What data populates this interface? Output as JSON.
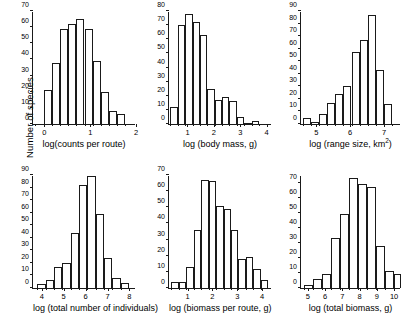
{
  "figure": {
    "shared_ylabel": "Number of species",
    "background": "#ffffff",
    "line_color": "#1a1a1a"
  },
  "chart_data": [
    {
      "id": "counts-per-route",
      "type": "bar",
      "title": "",
      "xlabel": "log(counts per route)",
      "ylabel": "Number of species",
      "xlim": [
        -0.25,
        2.0
      ],
      "ylim": [
        0,
        70
      ],
      "yticks": [
        0,
        10,
        20,
        30,
        40,
        50,
        60,
        70
      ],
      "xticks": [
        0,
        1,
        2
      ],
      "grid": false,
      "legend": "none",
      "bin_width": 0.175,
      "bin_starts": [
        -0.2,
        0.0,
        0.175,
        0.35,
        0.525,
        0.7,
        0.875,
        1.05,
        1.225,
        1.4,
        1.575,
        1.75
      ],
      "categories": [
        "-0.2",
        "0.0",
        "0.18",
        "0.35",
        "0.53",
        "0.70",
        "0.88",
        "1.05",
        "1.23",
        "1.40",
        "1.58",
        "1.75"
      ],
      "values": [
        0,
        21,
        38,
        59,
        62,
        65,
        59,
        39,
        20,
        8,
        6,
        0
      ]
    },
    {
      "id": "body-mass",
      "type": "bar",
      "title": "",
      "xlabel": "log (body mass, g)",
      "ylabel": "Number of species",
      "xlim": [
        0.3,
        4.2
      ],
      "ylim": [
        0,
        80
      ],
      "yticks": [
        0,
        10,
        20,
        30,
        40,
        50,
        60,
        70,
        80
      ],
      "xticks": [
        1,
        2,
        3,
        4
      ],
      "grid": false,
      "legend": "none",
      "bin_width": 0.28,
      "bin_starts": [
        0.35,
        0.63,
        0.91,
        1.19,
        1.47,
        1.75,
        2.03,
        2.31,
        2.59,
        2.87,
        3.15,
        3.43,
        3.71
      ],
      "categories": [
        "0.35",
        "0.63",
        "0.91",
        "1.19",
        "1.47",
        "1.75",
        "2.03",
        "2.31",
        "2.59",
        "2.87",
        "3.15",
        "3.43",
        "3.71"
      ],
      "values": [
        12,
        70,
        78,
        72,
        63,
        25,
        17,
        19,
        16,
        5,
        1,
        2,
        0
      ]
    },
    {
      "id": "range-size",
      "type": "bar",
      "title": "",
      "xlabel": "log (range size, km2)",
      "xlabel_base": "log (range size, km",
      "xlabel_sup": "2",
      "xlabel_tail": ")",
      "ylabel": "Number of species",
      "xlim": [
        4.55,
        7.5
      ],
      "ylim": [
        0,
        90
      ],
      "yticks": [
        0,
        10,
        20,
        30,
        40,
        50,
        60,
        70,
        80,
        90
      ],
      "xticks": [
        5,
        6,
        7
      ],
      "grid": false,
      "legend": "none",
      "bin_width": 0.24,
      "bin_starts": [
        4.6,
        4.84,
        5.08,
        5.32,
        5.56,
        5.8,
        6.04,
        6.28,
        6.52,
        6.76,
        7.0,
        7.24
      ],
      "categories": [
        "4.60",
        "4.84",
        "5.08",
        "5.32",
        "5.56",
        "5.80",
        "6.04",
        "6.28",
        "6.52",
        "6.76",
        "7.00",
        "7.24"
      ],
      "values": [
        5,
        2,
        8,
        17,
        24,
        30,
        57,
        67,
        87,
        43,
        16,
        0
      ]
    },
    {
      "id": "total-number-individuals",
      "type": "bar",
      "title": "",
      "xlabel": "log (total number of individuals)",
      "ylabel": "Number of species",
      "xlim": [
        3.6,
        8.3
      ],
      "ylim": [
        0,
        90
      ],
      "yticks": [
        0,
        10,
        20,
        30,
        40,
        50,
        60,
        70,
        80,
        90
      ],
      "xticks": [
        4,
        5,
        6,
        7,
        8
      ],
      "grid": false,
      "legend": "none",
      "bin_width": 0.38,
      "bin_starts": [
        3.8,
        4.18,
        4.56,
        4.94,
        5.32,
        5.7,
        6.08,
        6.46,
        6.84,
        7.22,
        7.6,
        7.98
      ],
      "categories": [
        "3.80",
        "4.18",
        "4.56",
        "4.94",
        "5.32",
        "5.70",
        "6.08",
        "6.46",
        "6.84",
        "7.22",
        "7.60",
        "7.98"
      ],
      "values": [
        3,
        6,
        17,
        20,
        44,
        82,
        89,
        59,
        24,
        8,
        4,
        0
      ]
    },
    {
      "id": "biomass-per-route",
      "type": "bar",
      "title": "",
      "xlabel": "log (biomass per route, g)",
      "ylabel": "Number of species",
      "xlim": [
        0.25,
        4.4
      ],
      "ylim": [
        0,
        70
      ],
      "yticks": [
        0,
        10,
        20,
        30,
        40,
        50,
        60,
        70
      ],
      "xticks": [
        1,
        2,
        3,
        4
      ],
      "grid": false,
      "legend": "none",
      "bin_width": 0.3,
      "bin_starts": [
        0.35,
        0.65,
        0.95,
        1.25,
        1.55,
        1.85,
        2.15,
        2.45,
        2.75,
        3.05,
        3.35,
        3.65,
        3.95
      ],
      "categories": [
        "0.35",
        "0.65",
        "0.95",
        "1.25",
        "1.55",
        "1.85",
        "2.15",
        "2.45",
        "2.75",
        "3.05",
        "3.35",
        "3.65",
        "3.95"
      ],
      "values": [
        4,
        4,
        13,
        36,
        67,
        66,
        51,
        49,
        36,
        18,
        19,
        12,
        5
      ]
    },
    {
      "id": "total-biomass",
      "type": "bar",
      "title": "",
      "xlabel": "log (total biomass, g)",
      "ylabel": "Number of species",
      "xlim": [
        4.6,
        10.4
      ],
      "ylim": [
        0,
        75
      ],
      "yticks": [
        0,
        10,
        20,
        30,
        40,
        50,
        60,
        70
      ],
      "xticks": [
        5,
        6,
        7,
        8,
        9,
        10
      ],
      "grid": false,
      "legend": "none",
      "bin_width": 0.52,
      "bin_starts": [
        4.8,
        5.32,
        5.84,
        6.36,
        6.88,
        7.4,
        7.92,
        8.44,
        8.96,
        9.48,
        10.0
      ],
      "categories": [
        "4.80",
        "5.32",
        "5.84",
        "6.36",
        "6.88",
        "7.40",
        "7.92",
        "8.44",
        "8.96",
        "9.48",
        "10.00"
      ],
      "values": [
        2,
        6,
        9,
        33,
        49,
        73,
        69,
        67,
        28,
        11,
        9
      ]
    }
  ]
}
